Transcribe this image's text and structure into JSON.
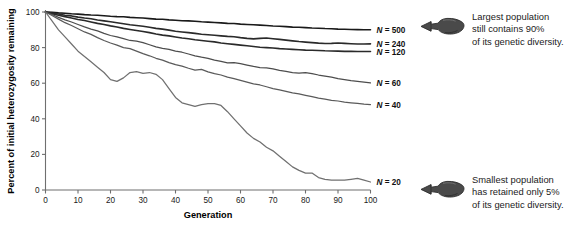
{
  "chart_data": {
    "type": "line",
    "title": "",
    "xlabel": "Generation",
    "ylabel": "Percent of initial heterozygosity remaining",
    "xlim": [
      0,
      100
    ],
    "ylim": [
      0,
      100
    ],
    "xticks": [
      0,
      10,
      20,
      30,
      40,
      50,
      60,
      70,
      80,
      90,
      100
    ],
    "yticks": [
      0,
      20,
      40,
      60,
      80,
      100
    ],
    "grid": false,
    "legend_position": "right-of-curve-ends",
    "series": [
      {
        "name": "N = 500",
        "label_value": 500,
        "color": "#1a1a1a",
        "end_value": 90,
        "x": [
          0,
          2,
          4,
          6,
          8,
          10,
          12,
          14,
          16,
          18,
          20,
          22,
          24,
          26,
          28,
          30,
          32,
          34,
          36,
          38,
          40,
          42,
          44,
          46,
          48,
          50,
          52,
          54,
          56,
          58,
          60,
          62,
          64,
          66,
          68,
          70,
          72,
          74,
          76,
          78,
          80,
          82,
          84,
          86,
          88,
          90,
          92,
          94,
          96,
          98,
          100
        ],
        "values": [
          100,
          99.8,
          99.5,
          99.3,
          99.0,
          98.8,
          98.5,
          98.3,
          98.2,
          97.9,
          97.6,
          97.4,
          97.3,
          97.0,
          96.8,
          96.6,
          96.3,
          96.0,
          95.9,
          95.6,
          95.4,
          95.1,
          95.0,
          94.8,
          94.5,
          94.3,
          94.1,
          93.9,
          93.6,
          93.5,
          93.2,
          93.0,
          92.8,
          92.6,
          92.4,
          92.1,
          92.0,
          91.8,
          91.5,
          91.4,
          91.2,
          91.0,
          90.9,
          90.7,
          90.6,
          90.4,
          90.3,
          90.2,
          90.1,
          90.0,
          90.0
        ]
      },
      {
        "name": "N = 240",
        "label_value": 240,
        "color": "#2a2a2a",
        "end_value": 82,
        "x": [
          0,
          2,
          4,
          6,
          8,
          10,
          12,
          14,
          16,
          18,
          20,
          22,
          24,
          26,
          28,
          30,
          32,
          34,
          36,
          38,
          40,
          42,
          44,
          46,
          48,
          50,
          52,
          54,
          56,
          58,
          60,
          62,
          64,
          66,
          68,
          70,
          72,
          74,
          76,
          78,
          80,
          82,
          84,
          86,
          88,
          90,
          92,
          94,
          96,
          98,
          100
        ],
        "values": [
          100,
          99.4,
          98.9,
          98.2,
          97.8,
          97.1,
          96.6,
          96.2,
          95.5,
          95.0,
          94.5,
          94.0,
          93.4,
          92.8,
          92.4,
          92.0,
          91.4,
          90.8,
          90.4,
          89.8,
          89.2,
          88.8,
          88.4,
          88.0,
          87.5,
          87.2,
          86.9,
          86.6,
          86.3,
          86.1,
          85.6,
          85.2,
          84.9,
          85.2,
          85.4,
          85.0,
          84.6,
          84.2,
          83.8,
          83.4,
          83.1,
          82.8,
          82.5,
          82.3,
          82.4,
          82.6,
          82.4,
          82.2,
          82.0,
          82.0,
          82.1
        ]
      },
      {
        "name": "N = 120",
        "label_value": 120,
        "color": "#2a2a2a",
        "end_value": 78,
        "x": [
          0,
          2,
          4,
          6,
          8,
          10,
          12,
          14,
          16,
          18,
          20,
          22,
          24,
          26,
          28,
          30,
          32,
          34,
          36,
          38,
          40,
          42,
          44,
          46,
          48,
          50,
          52,
          54,
          56,
          58,
          60,
          62,
          64,
          66,
          68,
          70,
          72,
          74,
          76,
          78,
          80,
          82,
          84,
          86,
          88,
          90,
          92,
          94,
          96,
          98,
          100
        ],
        "values": [
          100,
          99.0,
          98.2,
          97.4,
          96.6,
          95.8,
          95.2,
          94.4,
          93.6,
          93.0,
          92.2,
          91.6,
          90.8,
          90.2,
          89.6,
          89.0,
          88.4,
          87.6,
          87.0,
          86.6,
          86.0,
          85.4,
          85.0,
          84.4,
          84.0,
          83.6,
          83.2,
          82.6,
          82.2,
          81.8,
          81.4,
          81.0,
          80.6,
          80.2,
          80.0,
          79.8,
          79.4,
          79.2,
          79.0,
          78.8,
          78.6,
          78.5,
          78.4,
          78.2,
          78.1,
          78.0,
          77.9,
          77.9,
          77.8,
          77.8,
          77.8
        ]
      },
      {
        "name": "N = 60",
        "label_value": 60,
        "color": "#4d4d4d",
        "end_value": 60,
        "x": [
          0,
          2,
          4,
          6,
          8,
          10,
          12,
          14,
          16,
          18,
          20,
          22,
          24,
          26,
          28,
          30,
          32,
          34,
          36,
          38,
          40,
          42,
          44,
          46,
          48,
          50,
          52,
          54,
          56,
          58,
          60,
          62,
          64,
          66,
          68,
          70,
          72,
          74,
          76,
          78,
          80,
          82,
          84,
          86,
          88,
          90,
          92,
          94,
          96,
          98,
          100
        ],
        "values": [
          100,
          98.6,
          97.0,
          95.6,
          94.4,
          93.0,
          91.6,
          90.4,
          89.4,
          88.0,
          86.8,
          86.0,
          85.0,
          84.0,
          83.6,
          82.8,
          81.6,
          80.4,
          79.6,
          79.0,
          78.0,
          77.4,
          76.4,
          75.4,
          74.6,
          74.0,
          73.0,
          72.2,
          71.4,
          71.6,
          71.0,
          70.2,
          69.4,
          68.8,
          68.6,
          68.0,
          67.2,
          66.6,
          66.0,
          65.6,
          66.0,
          65.4,
          64.6,
          64.0,
          63.4,
          62.6,
          62.0,
          61.4,
          61.0,
          60.6,
          60.2
        ]
      },
      {
        "name": "N = 40",
        "label_value": 40,
        "color": "#5a5a5a",
        "end_value": 48,
        "x": [
          0,
          2,
          4,
          6,
          8,
          10,
          12,
          14,
          16,
          18,
          20,
          22,
          24,
          26,
          28,
          30,
          32,
          34,
          36,
          38,
          40,
          42,
          44,
          46,
          48,
          50,
          52,
          54,
          56,
          58,
          60,
          62,
          64,
          66,
          68,
          70,
          72,
          74,
          76,
          78,
          80,
          82,
          84,
          86,
          88,
          90,
          92,
          94,
          96,
          98,
          100
        ],
        "values": [
          100,
          98.0,
          96.0,
          94.0,
          92.4,
          90.6,
          88.8,
          87.4,
          85.6,
          84.0,
          82.6,
          81.4,
          80.0,
          79.4,
          78.0,
          76.6,
          75.4,
          74.0,
          73.0,
          71.6,
          70.4,
          69.6,
          68.4,
          67.4,
          67.8,
          66.4,
          65.4,
          64.6,
          63.4,
          62.6,
          61.6,
          60.6,
          59.6,
          59.0,
          58.0,
          57.0,
          56.2,
          55.4,
          54.6,
          54.0,
          53.2,
          52.4,
          51.6,
          51.0,
          50.4,
          50.0,
          49.4,
          49.0,
          48.6,
          48.2,
          48.0
        ]
      },
      {
        "name": "N = 20",
        "label_value": 20,
        "color": "#707070",
        "end_value": 5,
        "x": [
          0,
          2,
          4,
          6,
          8,
          10,
          12,
          14,
          16,
          18,
          20,
          22,
          24,
          26,
          28,
          30,
          32,
          34,
          36,
          38,
          40,
          42,
          44,
          46,
          48,
          50,
          52,
          54,
          56,
          58,
          60,
          62,
          64,
          66,
          68,
          70,
          72,
          74,
          76,
          78,
          80,
          82,
          84,
          86,
          88,
          90,
          92,
          94,
          96,
          98,
          100
        ],
        "values": [
          100,
          95.0,
          90.0,
          86.0,
          82.0,
          78.0,
          75.0,
          72.0,
          69.0,
          66.0,
          62.0,
          61.0,
          63.0,
          66.0,
          66.5,
          65.5,
          66.0,
          65.0,
          62.0,
          57.0,
          52.0,
          49.0,
          48.0,
          47.0,
          48.0,
          48.5,
          48.5,
          47.5,
          44.0,
          40.0,
          36.0,
          32.0,
          29.0,
          27.0,
          24.0,
          22.0,
          19.0,
          16.0,
          13.0,
          11.0,
          9.5,
          9.5,
          7.0,
          6.0,
          5.5,
          5.5,
          5.5,
          6.0,
          6.5,
          5.5,
          4.5
        ]
      }
    ],
    "annotations": [
      {
        "id": "top",
        "icon": "pointing-hand-right-icon",
        "lines": [
          "Largest population",
          "still contains 90%",
          "of its genetic diversity."
        ]
      },
      {
        "id": "bottom",
        "icon": "pointing-hand-right-icon",
        "lines": [
          "Smallest population",
          "has retained only 5%",
          "of its genetic diversity."
        ]
      }
    ]
  }
}
